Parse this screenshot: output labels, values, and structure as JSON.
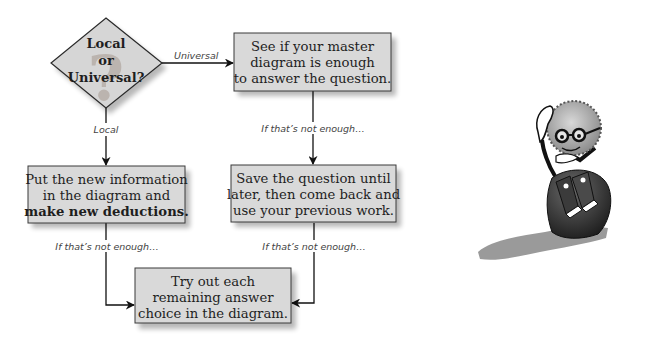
{
  "diagram": {
    "decision": {
      "lines": [
        "Local",
        "or",
        "Universal?"
      ],
      "watermark_glyph": "?"
    },
    "edges": {
      "universal": "Universal",
      "local": "Local",
      "not_enough_left": "If that’s not enough…",
      "not_enough_right_top": "If that’s not enough…",
      "not_enough_right_bottom": "If that’s not enough…"
    },
    "boxes": {
      "master_diagram": {
        "lines": [
          "See if your master",
          "diagram is enough",
          "to answer the question."
        ]
      },
      "new_info": {
        "lines": [
          "Put the new information",
          "in the diagram and",
          "make new deductions."
        ],
        "bold_line_index": 2
      },
      "save_question": {
        "lines": [
          "Save the question until",
          "later, then come back and",
          "use your previous work."
        ]
      },
      "try_choices": {
        "lines": [
          "Try out each",
          "remaining answer",
          "choice in the diagram."
        ]
      }
    },
    "illustration": {
      "description": "thinking-character-sitting-on-rock"
    }
  }
}
